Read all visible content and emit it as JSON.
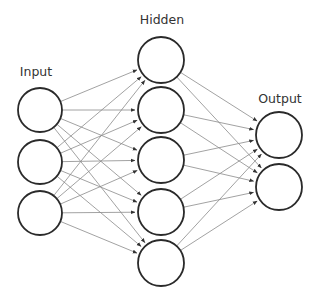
{
  "diagram": {
    "type": "feedforward-neural-network",
    "layers": [
      {
        "name": "Input",
        "label": "Input",
        "nodes": 3
      },
      {
        "name": "Hidden",
        "label": "Hidden",
        "nodes": 5
      },
      {
        "name": "Output",
        "label": "Output",
        "nodes": 2
      }
    ],
    "connections": "fully-connected, directed arrows left to right",
    "colors": {
      "node_stroke": "#2a2a2a",
      "edge": "#8a8a8a",
      "background": "#ffffff",
      "text": "#333333"
    }
  }
}
